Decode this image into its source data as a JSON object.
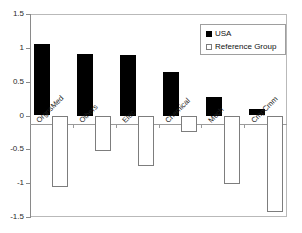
{
  "chart_data": {
    "type": "bar",
    "title": "",
    "subtitle": "",
    "xlabel": "",
    "ylabel": "",
    "categories": [
      "OrgnsMed",
      "Others",
      "Elec",
      "Chemical",
      "Mech",
      "CmpCmm"
    ],
    "series": [
      {
        "name": "USA",
        "color": "#000000",
        "values": [
          1.05,
          0.91,
          0.9,
          0.65,
          0.28,
          0.09
        ]
      },
      {
        "name": "Reference Group",
        "color": "#ffffff",
        "values": [
          -1.05,
          -0.52,
          -0.74,
          -0.24,
          -1.0,
          -1.42
        ]
      }
    ],
    "ylim": [
      -1.5,
      1.5
    ],
    "yticks": [
      "1.5",
      "1",
      "0.5",
      "0",
      "-0.5",
      "-1",
      "-1.5"
    ],
    "ytick_values": [
      1.5,
      1,
      0.5,
      0,
      -0.5,
      -1,
      -1.5
    ],
    "grid": false,
    "legend_position": "top-right",
    "legend_entries": [
      {
        "label": "USA",
        "swatch": "filled-square"
      },
      {
        "label": "Reference Group",
        "swatch": "hollow-square"
      }
    ],
    "frame_color": "#b9b9b9",
    "axis_color": "#8a8a8a",
    "bar_outline_color": "#7d7d7d"
  }
}
